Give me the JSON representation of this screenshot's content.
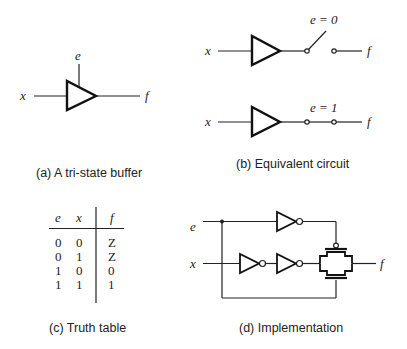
{
  "panels": {
    "a": {
      "caption": "(a) A tri-state buffer",
      "input_label": "x",
      "enable_label": "e",
      "output_label": "f"
    },
    "b": {
      "caption": "(b) Equivalent circuit",
      "top": {
        "input_label": "x",
        "switch_label": "e = 0",
        "output_label": "f",
        "switch_state": "open"
      },
      "bottom": {
        "input_label": "x",
        "switch_label": "e = 1",
        "output_label": "f",
        "switch_state": "closed"
      }
    },
    "c": {
      "caption": "(c) Truth table",
      "headers": [
        "e",
        "x",
        "f"
      ],
      "rows": [
        [
          "0",
          "0",
          "Z"
        ],
        [
          "0",
          "1",
          "Z"
        ],
        [
          "1",
          "0",
          "0"
        ],
        [
          "1",
          "1",
          "1"
        ]
      ]
    },
    "d": {
      "caption": "(d) Implementation",
      "enable_label": "e",
      "input_label": "x",
      "output_label": "f"
    }
  }
}
